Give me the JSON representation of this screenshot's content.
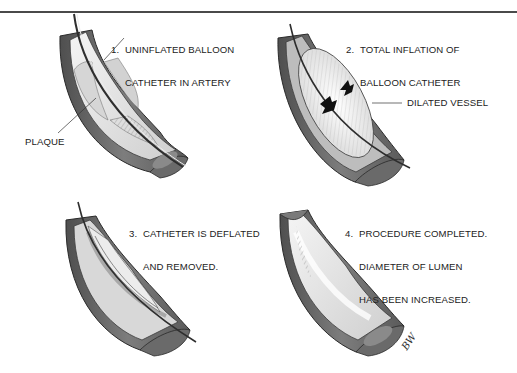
{
  "figure": {
    "colors": {
      "vessel_wall_dark": "#5e5e5e",
      "vessel_wall_mid": "#8a8a8a",
      "vessel_wall_light": "#b4b4b4",
      "lumen_light": "#e6e6e6",
      "plaque": "#d4d4d4",
      "balloon": "#f2f2f2",
      "catheter": "#3a3a3a",
      "text": "#222222",
      "rule": "#4a4a4a"
    },
    "panels": [
      {
        "id": 1,
        "number": "1.",
        "caption_lines": [
          "UNINFLATED BALLOON",
          "CATHETER IN ARTERY"
        ],
        "callouts": [
          {
            "label": "PLAQUE"
          }
        ]
      },
      {
        "id": 2,
        "number": "2.",
        "caption_lines": [
          "TOTAL INFLATION OF",
          "BALLOON CATHETER"
        ],
        "callouts": [
          {
            "label": "DILATED VESSEL"
          }
        ]
      },
      {
        "id": 3,
        "number": "3.",
        "caption_lines": [
          "CATHETER IS DEFLATED",
          "AND REMOVED."
        ],
        "callouts": []
      },
      {
        "id": 4,
        "number": "4.",
        "caption_lines": [
          "PROCEDURE COMPLETED.",
          "DIAMETER OF LUMEN",
          "HAS BEEN INCREASED."
        ],
        "callouts": []
      }
    ],
    "artist_signature": "BW"
  }
}
